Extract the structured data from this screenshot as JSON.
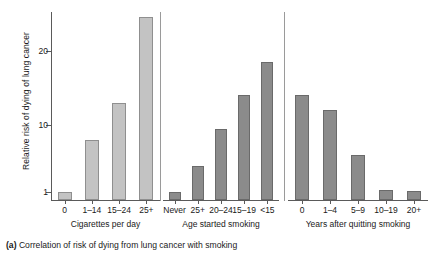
{
  "caption": {
    "prefix": "(a)",
    "text": " Correlation of risk of dying from lung cancer with smoking"
  },
  "chart_data": {
    "type": "bar",
    "title": "",
    "xlabel": "",
    "ylabel": "Relative risk of dying of lung cancer",
    "ylim": [
      0,
      26
    ],
    "yticks": [
      1,
      10,
      20
    ],
    "ytick_labels": [
      "1",
      "10",
      "20"
    ],
    "grid": false,
    "legend": "none",
    "panels": [
      {
        "name": "cigarettes-per-day",
        "xlabel": "Cigarettes per day",
        "categories": [
          "0",
          "1–14",
          "15–24",
          "25+"
        ],
        "values": [
          1.0,
          8.0,
          13.0,
          24.5
        ],
        "bar_color": "#c3c3c3"
      },
      {
        "name": "age-started-smoking",
        "xlabel": "Age started smoking",
        "categories": [
          "Never",
          "25+",
          "20–24",
          "15–19",
          "<15"
        ],
        "values": [
          1.0,
          4.5,
          9.5,
          14.0,
          18.5
        ],
        "bar_color": "#8b8b8b"
      },
      {
        "name": "years-after-quitting-smoking",
        "xlabel": "Years after quitting smoking",
        "categories": [
          "0",
          "1–4",
          "5–9",
          "10–19",
          "20+"
        ],
        "values": [
          14.0,
          12.0,
          6.0,
          1.3,
          1.1
        ],
        "bar_color": "#8b8b8b"
      }
    ]
  }
}
